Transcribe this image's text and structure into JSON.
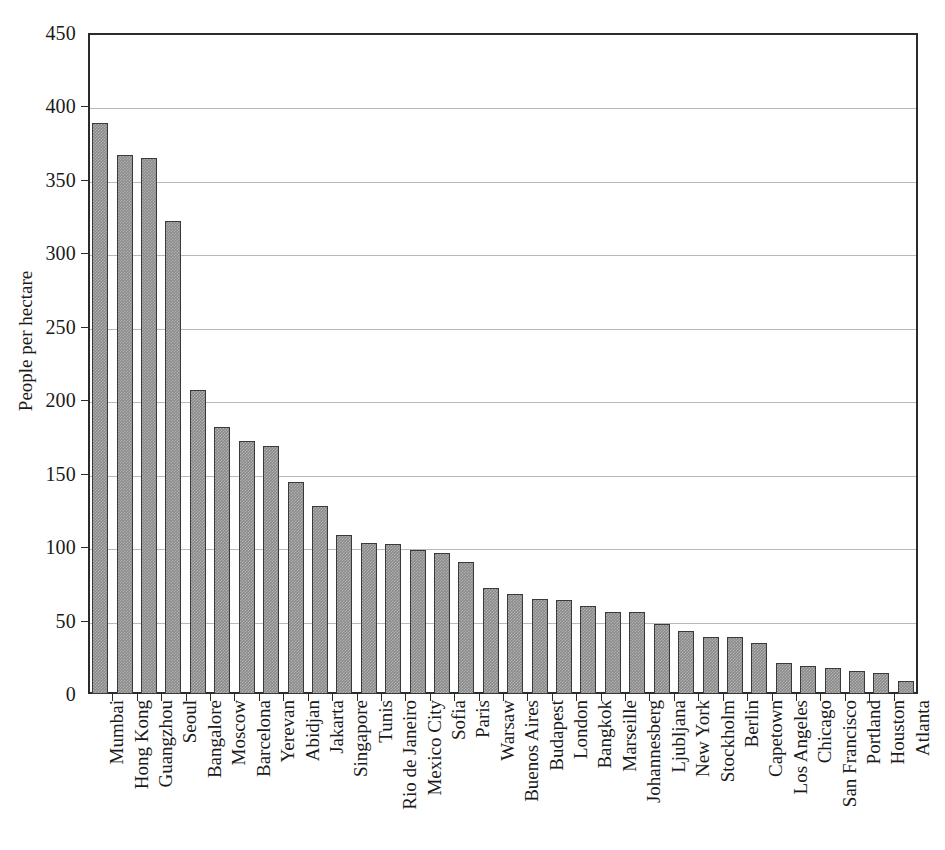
{
  "chart_data": {
    "type": "bar",
    "title": "",
    "xlabel": "",
    "ylabel": "People per hectare",
    "ylim": [
      0,
      450
    ],
    "yticks": [
      0,
      50,
      100,
      150,
      200,
      250,
      300,
      350,
      400,
      450
    ],
    "grid": true,
    "legend": null,
    "orientation": "vertical",
    "bar_color": "#8a8a8a",
    "bar_edge_color": "#3a3a3a",
    "categories": [
      "Mumbai",
      "Hong Kong",
      "Guangzhou",
      "Seoul",
      "Bangalore",
      "Moscow",
      "Barcelona",
      "Yerevan",
      "Abidjan",
      "Jakarta",
      "Singapore",
      "Tunis",
      "Rio de Janeiro",
      "Mexico City",
      "Sofia",
      "Paris",
      "Warsaw",
      "Buenos Aires",
      "Budapest",
      "London",
      "Bangkok",
      "Marseille",
      "Johannesberg",
      "Ljubljana",
      "New York",
      "Stockholm",
      "Berlin",
      "Capetown",
      "Los Angeles",
      "Chicago",
      "San Francisco",
      "Portland",
      "Houston",
      "Atlanta"
    ],
    "values": [
      389,
      367,
      365,
      322,
      207,
      182,
      172,
      169,
      144,
      128,
      108,
      103,
      102,
      98,
      96,
      90,
      72,
      68,
      65,
      64,
      60,
      56,
      56,
      48,
      43,
      39,
      39,
      35,
      21,
      19,
      18,
      16,
      14,
      9
    ]
  },
  "axes": {
    "y_axis_title": "People per hectare",
    "y_tick_labels": [
      "450",
      "400",
      "350",
      "300",
      "250",
      "200",
      "150",
      "100",
      "50",
      "0"
    ]
  }
}
